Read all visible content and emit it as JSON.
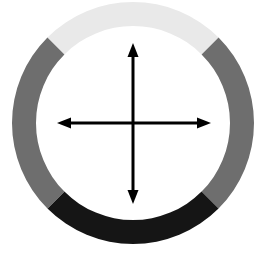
{
  "figure": {
    "background_color": "#ffffff",
    "width": 262,
    "height": 255
  },
  "chart_data": {
    "type": "pie",
    "subtitle": "",
    "xlabel": "",
    "ylabel": "",
    "legend_position": "none",
    "grid": false,
    "donut": true,
    "center_x": 133,
    "center_y": 123,
    "outer_radius": 121,
    "inner_radius": 97,
    "ring_thickness": 24,
    "categories": [
      "Top segment",
      "Right segment",
      "Bottom segment",
      "Left segment"
    ],
    "values": [
      25,
      25,
      25,
      25
    ],
    "units": "percent",
    "colors": [
      "#e9e9e9",
      "#6e6e6e",
      "#151515",
      "#6e6e6e"
    ],
    "segments": [
      {
        "name": "Top segment",
        "color": "#e9e9e9",
        "start_angle_deg": -135,
        "end_angle_deg": -45,
        "sweep_deg": 90,
        "value": 25
      },
      {
        "name": "Right segment",
        "color": "#6e6e6e",
        "start_angle_deg": -45,
        "end_angle_deg": 45,
        "sweep_deg": 90,
        "value": 25
      },
      {
        "name": "Bottom segment",
        "color": "#151515",
        "start_angle_deg": 45,
        "end_angle_deg": 135,
        "sweep_deg": 90,
        "value": 25
      },
      {
        "name": "Left segment",
        "color": "#6e6e6e",
        "start_angle_deg": 135,
        "end_angle_deg": 225,
        "sweep_deg": 90,
        "value": 25
      }
    ],
    "annotations": [
      {
        "name": "up-arrow",
        "direction": "up",
        "from_x": 133,
        "from_y": 123,
        "to_x": 133,
        "to_y": 43,
        "length": 80,
        "color": "#000000"
      },
      {
        "name": "down-arrow",
        "direction": "down",
        "from_x": 133,
        "from_y": 123,
        "to_x": 133,
        "to_y": 204,
        "length": 81,
        "color": "#000000"
      },
      {
        "name": "left-arrow",
        "direction": "left",
        "from_x": 133,
        "from_y": 123,
        "to_x": 57,
        "to_y": 123,
        "length": 76,
        "color": "#000000"
      },
      {
        "name": "right-arrow",
        "direction": "right",
        "from_x": 133,
        "from_y": 123,
        "to_x": 211,
        "to_y": 123,
        "length": 78,
        "color": "#000000"
      }
    ],
    "axis_color": "#000000",
    "axis_line_width": 3,
    "arrow_head_length": 14,
    "arrow_head_width": 11
  }
}
